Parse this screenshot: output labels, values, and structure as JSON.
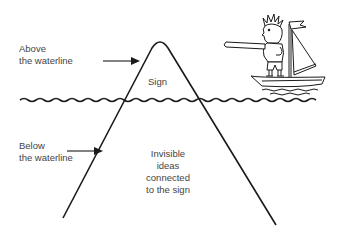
{
  "diagram": {
    "type": "iceberg-metaphor",
    "labels": {
      "above_line1": "Above",
      "above_line2": "the waterline",
      "below_line1": "Below",
      "below_line2": "the waterline",
      "tip": "Sign",
      "hidden_line1": "Invisible",
      "hidden_line2": "ideas",
      "hidden_line3": "connected",
      "hidden_line4": "to the sign"
    },
    "elements": {
      "waterline": "wavy-line",
      "iceberg": "triangle-outline",
      "observer": "man-pointing-on-sailboat"
    },
    "colors": {
      "stroke": "#1a1a1a",
      "text": "#444444",
      "background": "#ffffff"
    }
  }
}
